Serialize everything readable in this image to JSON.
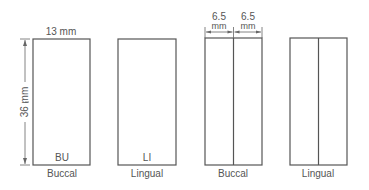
{
  "diagram": {
    "panels": [
      {
        "id": "buccal-single",
        "inner_label": "BU",
        "caption": "Buccal",
        "width_label": "13 mm",
        "height_label": "36 mm"
      },
      {
        "id": "lingual-single",
        "inner_label": "LI",
        "caption": "Lingual"
      },
      {
        "id": "buccal-split",
        "caption": "Buccal",
        "half_width_label_1": "6.5",
        "half_width_unit_1": "mm",
        "half_width_label_2": "6.5",
        "half_width_unit_2": "mm"
      },
      {
        "id": "lingual-split",
        "caption": "Lingual"
      }
    ]
  }
}
